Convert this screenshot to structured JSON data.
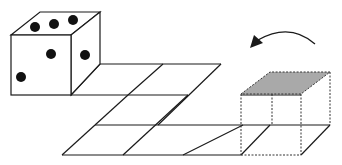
{
  "figure": {
    "description": "Die rolling over a grid of squares; the dashed cube marks the final position with its top face shaded.",
    "die": {
      "visible_faces": {
        "top_pips": 3,
        "front_pips": 2,
        "right_pips": 1
      }
    },
    "target_cube": {
      "style": "dashed",
      "top_face_color": "#a9a9a9"
    },
    "arrow": {
      "direction": "rolling toward die (right to left)"
    },
    "colors": {
      "line": "#1a1a1a",
      "pip": "#111111",
      "shade": "#a9a9a9",
      "background": "#ffffff"
    }
  }
}
